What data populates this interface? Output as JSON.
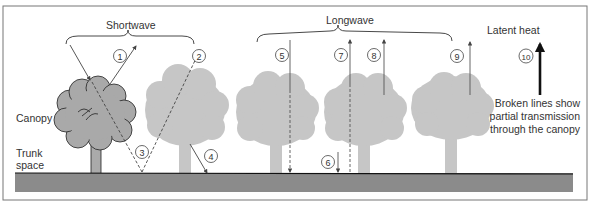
{
  "diagram": {
    "title_groups": {
      "shortwave": "Shortwave",
      "longwave": "Longwave",
      "latent_heat": "Latent heat"
    },
    "layer_labels": {
      "canopy": "Canopy",
      "trunk_space_line1": "Trunk",
      "trunk_space_line2": "space"
    },
    "legend": {
      "line1": "Broken lines show",
      "line2": "partial transmission",
      "line3": "through the canopy"
    },
    "markers": [
      "1",
      "2",
      "3",
      "4",
      "5",
      "6",
      "7",
      "8",
      "9",
      "10"
    ],
    "colors": {
      "ground": "#8a8a8a",
      "tree_foreground": "#a8a8a8",
      "tree_background": "#c4c4c4",
      "arrow": "#555555",
      "frame": "#777777"
    }
  }
}
